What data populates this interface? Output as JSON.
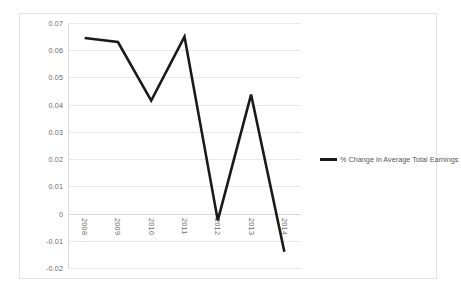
{
  "chart_data": {
    "type": "line",
    "title": "",
    "xlabel": "",
    "ylabel": "",
    "categories": [
      "2008",
      "2009",
      "2010",
      "2011",
      "2012",
      "2013",
      "2014"
    ],
    "series": [
      {
        "name": "% Change in Average Total Earnings",
        "color": "#1a1a1a",
        "values": [
          0.0645,
          0.063,
          0.0415,
          0.065,
          -0.0025,
          0.0437,
          -0.014
        ]
      }
    ],
    "ylim": [
      -0.02,
      0.07
    ],
    "y_ticks": [
      "0.07",
      "0.06",
      "0.05",
      "0.04",
      "0.03",
      "0.02",
      "0.01",
      "0",
      "-0.01",
      "-0.02"
    ],
    "y_tick_values": [
      0.07,
      0.06,
      0.05,
      0.04,
      0.03,
      0.02,
      0.01,
      0,
      -0.01,
      -0.02
    ],
    "grid": true,
    "legend_position": "right",
    "x_labels_rotated": true
  },
  "legend": {
    "entries": [
      {
        "label": "% Change in Average Total Earnings",
        "color": "#1a1a1a"
      }
    ]
  }
}
